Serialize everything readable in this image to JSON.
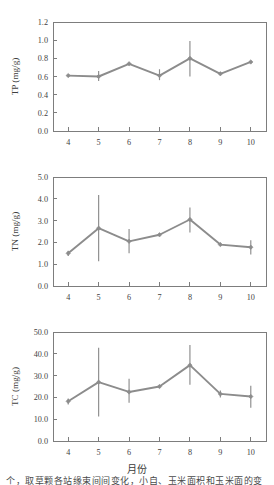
{
  "figure": {
    "x_axis_title": "月份",
    "caption": "个，取草颗各站缘束间间变化，小自、玉米面积和玉米面的变"
  },
  "chart_data": [
    {
      "type": "line",
      "panel_id": "TP",
      "title": "",
      "xlabel": "",
      "ylabel": "TP (mg/g)",
      "categories": [
        "4",
        "5",
        "6",
        "7",
        "8",
        "9",
        "10"
      ],
      "x": [
        4,
        5,
        6,
        7,
        8,
        9,
        10
      ],
      "values": [
        0.61,
        0.6,
        0.74,
        0.61,
        0.8,
        0.63,
        0.76
      ],
      "error_low": [
        0.6,
        0.55,
        0.73,
        0.56,
        0.6,
        0.62,
        0.75
      ],
      "error_high": [
        0.62,
        0.66,
        0.75,
        0.68,
        0.99,
        0.64,
        0.77
      ],
      "ylim": [
        0.0,
        1.2
      ],
      "yticks": [
        "0.0",
        "0.2",
        "0.4",
        "0.6",
        "0.8",
        "1.0",
        "1.2"
      ],
      "ytick_values": [
        0.0,
        0.2,
        0.4,
        0.6,
        0.8,
        1.0,
        1.2
      ],
      "xlim": [
        3.5,
        10.5
      ],
      "xticks": [
        "4",
        "5",
        "6",
        "7",
        "8",
        "9",
        "10"
      ],
      "grid": false,
      "legend": "none",
      "marker": "diamond",
      "line_color": "#8c8c8c"
    },
    {
      "type": "line",
      "panel_id": "TN",
      "title": "",
      "xlabel": "",
      "ylabel": "TN (mg/g)",
      "categories": [
        "4",
        "5",
        "6",
        "7",
        "8",
        "9",
        "10"
      ],
      "x": [
        4,
        5,
        6,
        7,
        8,
        9,
        10
      ],
      "values": [
        1.5,
        2.65,
        2.05,
        2.35,
        3.05,
        1.9,
        1.78
      ],
      "error_low": [
        1.38,
        1.13,
        1.5,
        2.3,
        2.45,
        1.85,
        1.45
      ],
      "error_high": [
        1.62,
        4.18,
        2.62,
        2.4,
        3.6,
        1.98,
        2.1
      ],
      "ylim": [
        0.0,
        5.0
      ],
      "yticks": [
        "0.0",
        "1.0",
        "2.0",
        "3.0",
        "4.0",
        "5.0"
      ],
      "ytick_values": [
        0.0,
        1.0,
        2.0,
        3.0,
        4.0,
        5.0
      ],
      "xlim": [
        3.5,
        10.5
      ],
      "xticks": [
        "4",
        "5",
        "6",
        "7",
        "8",
        "9",
        "10"
      ],
      "grid": false,
      "legend": "none",
      "marker": "diamond",
      "line_color": "#8c8c8c"
    },
    {
      "type": "line",
      "panel_id": "TC",
      "title": "",
      "xlabel": "月份",
      "ylabel": "TC (mg/g)",
      "categories": [
        "4",
        "5",
        "6",
        "7",
        "8",
        "9",
        "10"
      ],
      "x": [
        4,
        5,
        6,
        7,
        8,
        9,
        10
      ],
      "values": [
        18.2,
        27.0,
        22.5,
        25.0,
        34.8,
        21.6,
        20.4
      ],
      "error_low": [
        16.8,
        11.2,
        17.5,
        24.3,
        25.8,
        20.0,
        15.2
      ],
      "error_high": [
        19.5,
        42.8,
        28.6,
        25.6,
        44.0,
        23.2,
        25.4
      ],
      "ylim": [
        0.0,
        50.0
      ],
      "yticks": [
        "0.0",
        "10.0",
        "20.0",
        "30.0",
        "40.0",
        "50.0"
      ],
      "ytick_values": [
        0.0,
        10.0,
        20.0,
        30.0,
        40.0,
        50.0
      ],
      "xlim": [
        3.5,
        10.5
      ],
      "xticks": [
        "4",
        "5",
        "6",
        "7",
        "8",
        "9",
        "10"
      ],
      "grid": false,
      "legend": "none",
      "marker": "diamond",
      "line_color": "#8c8c8c"
    }
  ]
}
